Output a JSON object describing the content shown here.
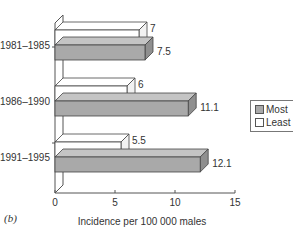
{
  "chart_data": {
    "type": "bar",
    "orientation": "horizontal",
    "style": "3d",
    "categories": [
      "1981–1985",
      "1986–1990",
      "1991–1995"
    ],
    "series": [
      {
        "name": "Most",
        "color": "#a9a9a9",
        "values": [
          7.5,
          11.1,
          12.1
        ]
      },
      {
        "name": "Least",
        "color": "#ffffff",
        "values": [
          7,
          6,
          5.5
        ]
      }
    ],
    "value_labels": {
      "Most": [
        "7.5",
        "11.1",
        "12.1"
      ],
      "Least": [
        "7",
        "6",
        "5.5"
      ]
    },
    "title": "",
    "xlabel": "Incidence per 100 000 males",
    "ylabel": "",
    "xlim": [
      0,
      15
    ],
    "xticks": [
      "0",
      "5",
      "10",
      "15"
    ],
    "grid": false,
    "legend_position": "right"
  },
  "legend": {
    "items": [
      {
        "label": "Most",
        "color": "#a9a9a9"
      },
      {
        "label": "Least",
        "color": "#ffffff"
      }
    ]
  },
  "caption": "(b)"
}
